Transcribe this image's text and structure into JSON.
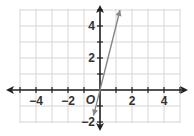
{
  "chart_data": {
    "type": "line",
    "title": "",
    "xlabel": "",
    "ylabel": "",
    "xlim": [
      -5,
      5
    ],
    "ylim": [
      -2,
      5
    ],
    "grid": true,
    "x_tick_labels": [
      "−4",
      "−2",
      "2",
      "4"
    ],
    "x_tick_values": [
      -4,
      -2,
      2,
      4
    ],
    "y_tick_labels": [
      "4",
      "2",
      "−2"
    ],
    "y_tick_values": [
      4,
      2,
      -2
    ],
    "origin_label": "O",
    "series": [
      {
        "name": "line",
        "equation": "y = 4x",
        "x": [
          -0.4,
          1.25
        ],
        "y": [
          -1.6,
          5.0
        ],
        "color": "#888888",
        "arrows": "both"
      }
    ]
  },
  "colors": {
    "axis": "#222222",
    "grid": "#d6d6d6",
    "line": "#888888"
  }
}
